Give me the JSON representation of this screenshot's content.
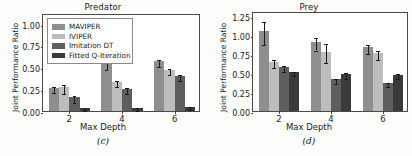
{
  "figure": {
    "panels": [
      {
        "key": "predator",
        "caption": "(c)",
        "title": "Predator",
        "ylabel": "Joint Performance Ratio",
        "xlabel": "Max Depth",
        "yticks": [
          "0.00",
          "0.25",
          "0.50",
          "0.75",
          "1.00"
        ],
        "xticks": [
          "2",
          "4",
          "6"
        ],
        "show_legend": true
      },
      {
        "key": "prey",
        "caption": "(d)",
        "title": "Prey",
        "ylabel": "Joint Performance Ratio",
        "xlabel": "Max Depth",
        "yticks": [
          "0.00",
          "0.25",
          "0.50",
          "0.75",
          "1.00",
          "1.25"
        ],
        "xticks": [
          "2",
          "4",
          "6"
        ],
        "show_legend": false
      }
    ]
  },
  "legend": {
    "entries": [
      {
        "label": "MAVIPER",
        "color": "#8e8e8e"
      },
      {
        "label": "IVIPER",
        "color": "#bdbdbd"
      },
      {
        "label": "Imitation DT",
        "color": "#5e5e5e"
      },
      {
        "label": "Fitted Q-Iteration",
        "color": "#3a3a3a"
      }
    ]
  },
  "chart_data": [
    {
      "type": "bar",
      "title": "Predator",
      "caption": "(c)",
      "xlabel": "Max Depth",
      "ylabel": "Joint Performance Ratio",
      "categories": [
        "2",
        "4",
        "6"
      ],
      "ylim": [
        0.0,
        1.12
      ],
      "yticks": [
        0.0,
        0.25,
        0.5,
        0.75,
        1.0
      ],
      "grid": false,
      "legend_position": "upper left",
      "series": [
        {
          "name": "MAVIPER",
          "color": "#8e8e8e",
          "values": [
            0.26,
            0.54,
            0.57
          ],
          "errors": [
            0.035,
            0.045,
            0.04
          ]
        },
        {
          "name": "IVIPER",
          "color": "#bdbdbd",
          "values": [
            0.27,
            0.33,
            0.47
          ],
          "errors": [
            0.055,
            0.035,
            0.035
          ]
        },
        {
          "name": "Imitation DT",
          "color": "#5e5e5e",
          "values": [
            0.16,
            0.25,
            0.4
          ],
          "errors": [
            0.04,
            0.035,
            0.03
          ]
        },
        {
          "name": "Fitted Q-Iteration",
          "color": "#3a3a3a",
          "values": [
            0.03,
            0.04,
            0.05
          ],
          "errors": [
            0.012,
            0.015,
            0.015
          ]
        }
      ]
    },
    {
      "type": "bar",
      "title": "Prey",
      "caption": "(d)",
      "xlabel": "Max Depth",
      "ylabel": "Joint Performance Ratio",
      "categories": [
        "2",
        "4",
        "6"
      ],
      "ylim": [
        0.0,
        1.32
      ],
      "yticks": [
        0.0,
        0.25,
        0.5,
        0.75,
        1.0,
        1.25
      ],
      "grid": false,
      "legend_position": "none",
      "series": [
        {
          "name": "MAVIPER",
          "color": "#8e8e8e",
          "values": [
            1.05,
            0.91,
            0.84
          ],
          "errors": [
            0.155,
            0.085,
            0.06
          ]
        },
        {
          "name": "IVIPER",
          "color": "#bdbdbd",
          "values": [
            0.65,
            0.78,
            0.76
          ],
          "errors": [
            0.055,
            0.125,
            0.055
          ]
        },
        {
          "name": "Imitation DT",
          "color": "#5e5e5e",
          "values": [
            0.58,
            0.42,
            0.37
          ],
          "errors": [
            0.04,
            0.035,
            0.03
          ]
        },
        {
          "name": "Fitted Q-Iteration",
          "color": "#3a3a3a",
          "values": [
            0.51,
            0.49,
            0.48
          ],
          "errors": [
            0.025,
            0.04,
            0.035
          ]
        }
      ]
    }
  ]
}
